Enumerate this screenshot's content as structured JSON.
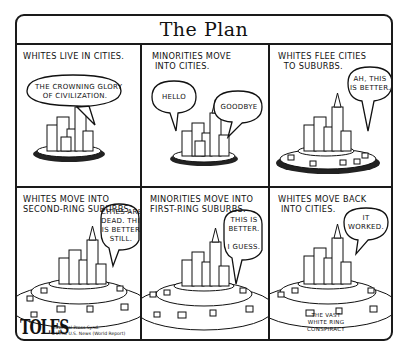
{
  "comic": {
    "title": "The Plan",
    "panels": [
      {
        "caption": "Whites live in cities.",
        "bubbles": [
          "The crowning glory\nof civilization."
        ]
      },
      {
        "caption": "Minorities move\n into cities.",
        "bubbles": [
          "Hello",
          "Goodbye"
        ]
      },
      {
        "caption": "Whites flee cities\n  to suburbs.",
        "bubbles": [
          "Ah, this\nis better."
        ]
      },
      {
        "caption": "Whites move into\nsecond-ring suburbs.",
        "bubbles": [
          "Cities are\ndead. This\nis better\nstill."
        ]
      },
      {
        "caption": "Minorities move into\nfirst-ring suburbs.",
        "bubbles": [
          "This is\nbetter.\n\nI guess."
        ]
      },
      {
        "caption": "Whites move back\n into cities.",
        "bubbles": [
          "It\nworked."
        ]
      }
    ],
    "signature": "TOLES",
    "credit": "Universal Press Synd.\n©1998 U.S. News (World Report)",
    "footnote": "The vast\nwhite ring\nconspiracy"
  }
}
